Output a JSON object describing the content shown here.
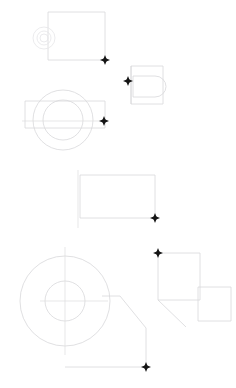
{
  "app": {
    "title": "CAD Drawing Canvas",
    "background_color": "#ffffff",
    "line_color": "#d8d8da",
    "faint_line_color": "#e6e6e8",
    "center_line_color": "#dcdcde",
    "marker_color": "#151515",
    "canvas_width": 236,
    "canvas_height": 388
  },
  "views": [
    {
      "id": "view-top-left",
      "name": "rectangular-plate-with-concentric-bore",
      "label": "Top left view",
      "rect": {
        "x": 48,
        "y": 12,
        "width": 57,
        "height": 48
      },
      "circles": [
        {
          "cx": 44,
          "cy": 38,
          "r": 11
        },
        {
          "cx": 44,
          "cy": 38,
          "r": 7
        },
        {
          "cx": 44,
          "cy": 38,
          "r": 4
        }
      ]
    },
    {
      "id": "view-right-upper",
      "name": "rectangle-with-d-slot",
      "label": "Upper right view",
      "outer_rect": {
        "x": 131,
        "y": 66,
        "width": 32,
        "height": 38
      },
      "inner_rect": {
        "x": 133,
        "y": 76,
        "width": 22,
        "height": 21
      },
      "arc_label": "d-shaped-end-arc"
    },
    {
      "id": "view-left-middle",
      "name": "rectangle-with-two-concentric-circles",
      "label": "Middle left view",
      "rect": {
        "x": 25,
        "y": 101,
        "width": 80,
        "height": 27
      },
      "circles": [
        {
          "cx": 63,
          "cy": 120,
          "r": 30
        },
        {
          "cx": 63,
          "cy": 120,
          "r": 20
        }
      ]
    },
    {
      "id": "view-middle",
      "name": "rectangle-with-vertical-centerline",
      "label": "Middle view",
      "rect": {
        "x": 80,
        "y": 175,
        "width": 75,
        "height": 43
      },
      "centerline": {
        "x": 78,
        "y1": 170,
        "y2": 228
      }
    },
    {
      "id": "view-bottom-left",
      "name": "large-circle-with-inner-bore-and-tangent-flange",
      "label": "Bottom left view",
      "outer_circle": {
        "cx": 65,
        "cy": 301,
        "r": 45
      },
      "inner_circle": {
        "cx": 65,
        "cy": 301,
        "r": 20
      },
      "crosshair": {
        "cx": 65,
        "cy": 301,
        "extent": 54
      },
      "flange_points": "102,296 120,296 146,328 146,367 65,367"
    },
    {
      "id": "view-bottom-right",
      "name": "two-overlapping-rectangles-with-diagonal",
      "label": "Bottom right view",
      "rect_a": {
        "x": 158,
        "y": 253,
        "width": 42,
        "height": 47
      },
      "rect_b": {
        "x": 198,
        "y": 287,
        "width": 33,
        "height": 34
      },
      "diagonal": {
        "x1": 158,
        "y1": 300,
        "x2": 186,
        "y2": 327
      }
    }
  ],
  "markers": [
    {
      "id": "marker-1",
      "name": "snap-point-top-rect-corner",
      "x": 105,
      "y": 60
    },
    {
      "id": "marker-2",
      "name": "snap-point-right-view-corner",
      "x": 128,
      "y": 81
    },
    {
      "id": "marker-3",
      "name": "snap-point-middle-left-rect-edge",
      "x": 104,
      "y": 121
    },
    {
      "id": "marker-4",
      "name": "snap-point-middle-rect-corner",
      "x": 155,
      "y": 218
    },
    {
      "id": "marker-5",
      "name": "snap-point-bottom-right-rect-corner",
      "x": 158,
      "y": 253
    },
    {
      "id": "marker-6",
      "name": "snap-point-bottom-flange-corner",
      "x": 146,
      "y": 367
    }
  ]
}
